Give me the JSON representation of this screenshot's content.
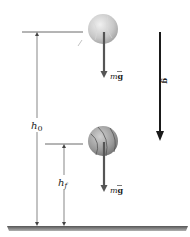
{
  "diagram": {
    "labels": {
      "initial_height": "h",
      "initial_height_sub": "0",
      "final_height": "h",
      "final_height_sub": "f",
      "weight_top_m": "m",
      "weight_top_g": "g",
      "weight_bottom_m": "m",
      "weight_bottom_g": "g",
      "gravity": "g"
    },
    "colors": {
      "ball_top": "#c8c8c8",
      "ball_bottom": "#9a9a9a",
      "arrow": "#555555",
      "gravity_arrow": "#1a1a1a",
      "ground": "#7a7a7a",
      "lines": "#444444"
    }
  }
}
